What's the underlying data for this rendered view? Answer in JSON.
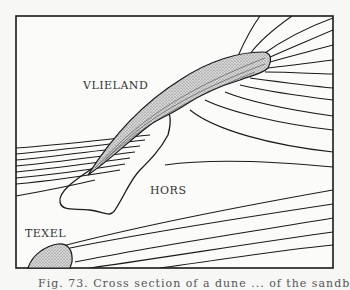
{
  "figure": {
    "labels": {
      "vlieland": "VLIELAND",
      "hors": "HORS",
      "texel": "TEXEL"
    },
    "caption": "Fig. 73. Cross section of a dune ... of the sandb",
    "colors": {
      "ink": "#1a1a1a",
      "paper": "#f7f7f5",
      "stipple": "#888888"
    }
  }
}
